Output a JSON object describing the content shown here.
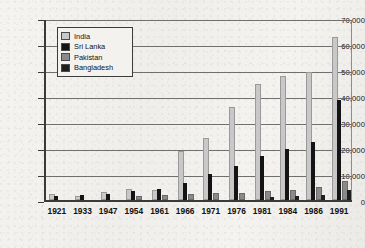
{
  "chart_data": {
    "type": "bar",
    "title": "",
    "xlabel": "",
    "ylabel": "",
    "ylim": [
      0,
      70000
    ],
    "ytick_step": 10000,
    "grid": true,
    "legend_position": "top-left-inside",
    "categories": [
      "1921",
      "1933",
      "1947",
      "1954",
      "1961",
      "1966",
      "1971",
      "1976",
      "1981",
      "1984",
      "1986",
      "1991"
    ],
    "ytick_labels": [
      "0",
      "10,000",
      "20,000",
      "30,000",
      "40,000",
      "50,000",
      "60,000",
      "70,000"
    ],
    "series": [
      {
        "name": "India",
        "color": "#c8c8c8",
        "values": [
          1400,
          900,
          2300,
          3300,
          2900,
          18000,
          23000,
          35000,
          44000,
          47000,
          48500,
          62000
        ]
      },
      {
        "name": "Sri Lanka",
        "color": "#141414",
        "values": [
          1700,
          1900,
          2400,
          3300,
          4200,
          6700,
          9900,
          13000,
          17000,
          19500,
          22300,
          38500
        ]
      },
      {
        "name": "Pakistan",
        "color": "#8a8a8a",
        "values": [
          0,
          0,
          0,
          900,
          1200,
          1500,
          1900,
          2000,
          2800,
          3200,
          4300,
          6500
        ]
      },
      {
        "name": "Bangladesh",
        "color": "#1f1f1f",
        "values": [
          0,
          0,
          0,
          0,
          0,
          0,
          0,
          0,
          1300,
          1600,
          1900,
          3900
        ]
      }
    ]
  },
  "legend": {
    "items": [
      {
        "label": "India",
        "swatch": "legend-swatch-india"
      },
      {
        "label": "Sri Lanka",
        "swatch": "legend-swatch-sri-lanka"
      },
      {
        "label": "Pakistan",
        "swatch": "legend-swatch-pakistan"
      },
      {
        "label": "Bangladesh",
        "swatch": "legend-swatch-bangladesh"
      }
    ]
  }
}
